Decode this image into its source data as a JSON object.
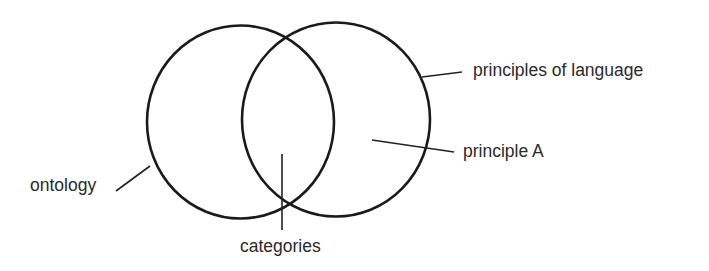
{
  "diagram": {
    "type": "venn",
    "colors": {
      "stroke": "#1a1a1a",
      "text": "#2a2a2a",
      "background": "#ffffff"
    },
    "sets": [
      {
        "id": "left",
        "label": "ontology"
      },
      {
        "id": "right",
        "label": "principles of language"
      }
    ],
    "regions": [
      {
        "id": "intersection",
        "label": "categories"
      },
      {
        "id": "right-only",
        "label": "principle A"
      }
    ],
    "labels": {
      "ontology": "ontology",
      "principles_of_language": "principles of language",
      "principle_a": "principle A",
      "categories": "categories"
    }
  }
}
